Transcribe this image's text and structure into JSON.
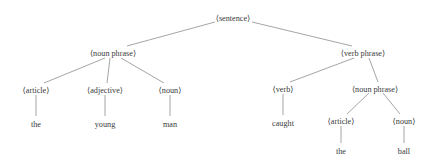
{
  "figure": {
    "name": "parse-tree",
    "title": "",
    "background_color": "#ffffff",
    "edge_color": "#8e8e8e",
    "text_color": "#3a3a3a"
  },
  "nodes": {
    "sentence": {
      "label": "⟨sentence⟩",
      "x": 233,
      "y": 18,
      "type": "nonterminal"
    },
    "np_left": {
      "label": "⟨noun phrase⟩",
      "x": 113,
      "y": 53,
      "type": "nonterminal"
    },
    "vp": {
      "label": "⟨verb phrase⟩",
      "x": 363,
      "y": 53,
      "type": "nonterminal"
    },
    "article_left": {
      "label": "⟨article⟩",
      "x": 36,
      "y": 90,
      "type": "nonterminal"
    },
    "adjective": {
      "label": "⟨adjective⟩",
      "x": 105,
      "y": 90,
      "type": "nonterminal"
    },
    "noun_left": {
      "label": "⟨noun⟩",
      "x": 170,
      "y": 90,
      "type": "nonterminal"
    },
    "verb": {
      "label": "⟨verb⟩",
      "x": 283,
      "y": 89,
      "type": "nonterminal"
    },
    "np_right": {
      "label": "⟨noun phrase⟩",
      "x": 375,
      "y": 89,
      "type": "nonterminal"
    },
    "article_right": {
      "label": "⟨article⟩",
      "x": 341,
      "y": 121,
      "type": "nonterminal"
    },
    "noun_right": {
      "label": "⟨noun⟩",
      "x": 404,
      "y": 121,
      "type": "nonterminal"
    },
    "word_the_1": {
      "label": "the",
      "x": 36,
      "y": 124,
      "type": "terminal"
    },
    "word_young": {
      "label": "young",
      "x": 105,
      "y": 124,
      "type": "terminal"
    },
    "word_man": {
      "label": "man",
      "x": 170,
      "y": 124,
      "type": "terminal"
    },
    "word_caught": {
      "label": "caught",
      "x": 283,
      "y": 123,
      "type": "terminal"
    },
    "word_the_2": {
      "label": "the",
      "x": 341,
      "y": 151,
      "type": "terminal"
    },
    "word_ball": {
      "label": "ball",
      "x": 404,
      "y": 151,
      "type": "terminal"
    }
  },
  "edges": [
    {
      "name": "edge-sentence-to-noun-phrase",
      "from": "sentence",
      "to": "np_left",
      "x1": 215,
      "y1": 22,
      "x2": 127,
      "y2": 46
    },
    {
      "name": "edge-sentence-to-verb-phrase",
      "from": "sentence",
      "to": "vp",
      "x1": 252,
      "y1": 22,
      "x2": 352,
      "y2": 46
    },
    {
      "name": "edge-noun-phrase-to-article",
      "from": "np_left",
      "to": "article_left",
      "x1": 105,
      "y1": 58,
      "x2": 44,
      "y2": 83
    },
    {
      "name": "edge-noun-phrase-to-adjective",
      "from": "np_left",
      "to": "adjective",
      "x1": 110,
      "y1": 58,
      "x2": 107,
      "y2": 83
    },
    {
      "name": "edge-noun-phrase-to-noun",
      "from": "np_left",
      "to": "noun_left",
      "x1": 121,
      "y1": 58,
      "x2": 164,
      "y2": 83
    },
    {
      "name": "edge-verb-phrase-to-verb",
      "from": "vp",
      "to": "verb",
      "x1": 354,
      "y1": 58,
      "x2": 290,
      "y2": 82
    },
    {
      "name": "edge-verb-phrase-to-noun-phrase",
      "from": "vp",
      "to": "np_right",
      "x1": 369,
      "y1": 58,
      "x2": 378,
      "y2": 82
    },
    {
      "name": "edge-noun-phrase-to-article-right",
      "from": "np_right",
      "to": "article_right",
      "x1": 369,
      "y1": 93,
      "x2": 347,
      "y2": 114
    },
    {
      "name": "edge-noun-phrase-to-noun-right",
      "from": "np_right",
      "to": "noun_right",
      "x1": 383,
      "y1": 93,
      "x2": 400,
      "y2": 114
    },
    {
      "name": "edge-article-to-the",
      "from": "article_left",
      "to": "word_the_1",
      "x1": 36,
      "y1": 95,
      "x2": 36,
      "y2": 116
    },
    {
      "name": "edge-adjective-to-young",
      "from": "adjective",
      "to": "word_young",
      "x1": 105,
      "y1": 95,
      "x2": 105,
      "y2": 116
    },
    {
      "name": "edge-noun-to-man",
      "from": "noun_left",
      "to": "word_man",
      "x1": 170,
      "y1": 95,
      "x2": 170,
      "y2": 116
    },
    {
      "name": "edge-verb-to-caught",
      "from": "verb",
      "to": "word_caught",
      "x1": 283,
      "y1": 94,
      "x2": 283,
      "y2": 115
    },
    {
      "name": "edge-article-right-to-the",
      "from": "article_right",
      "to": "word_the_2",
      "x1": 341,
      "y1": 126,
      "x2": 341,
      "y2": 143
    },
    {
      "name": "edge-noun-right-to-ball",
      "from": "noun_right",
      "to": "word_ball",
      "x1": 404,
      "y1": 126,
      "x2": 404,
      "y2": 143
    }
  ],
  "sentence_text": "the young man caught the ball"
}
